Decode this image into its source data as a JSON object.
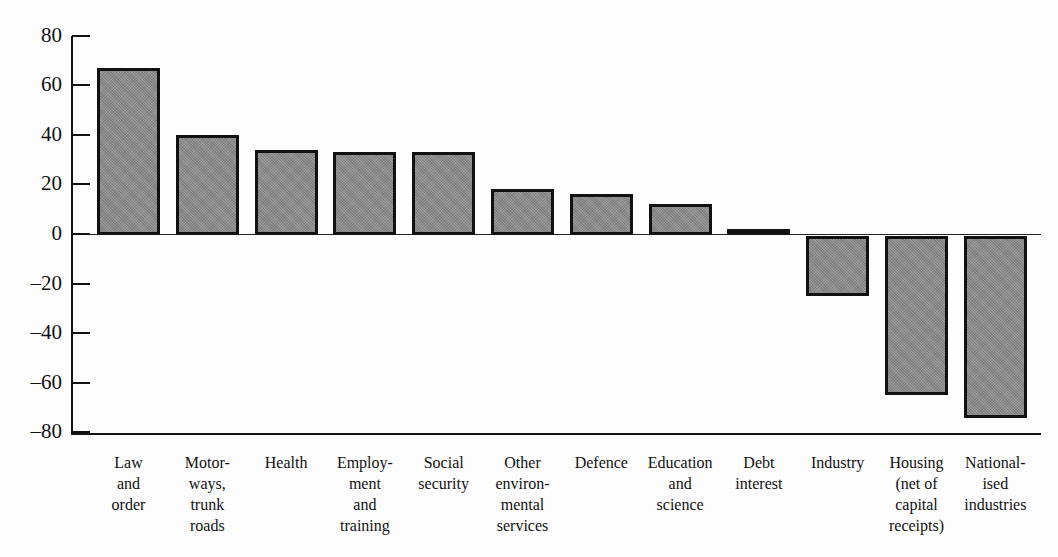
{
  "chart_data": {
    "type": "bar",
    "title": "",
    "xlabel": "",
    "ylabel": "",
    "ylim": [
      -80,
      80
    ],
    "yticks": [
      80,
      60,
      40,
      20,
      0,
      -20,
      -40,
      -60,
      -80
    ],
    "ytick_labels": [
      "80",
      "60",
      "40",
      "20",
      "0",
      "–20",
      "–40",
      "–60",
      "–80"
    ],
    "grid": false,
    "legend": null,
    "categories": [
      "Law and order",
      "Motorways, trunk roads",
      "Health",
      "Employment and training",
      "Social security",
      "Other environmental services",
      "Defence",
      "Education and science",
      "Debt interest",
      "Industry",
      "Housing (net of capital receipts)",
      "Nationalised industries"
    ],
    "category_label_lines": [
      [
        "Law",
        "and",
        "order"
      ],
      [
        "Motor-",
        "ways,",
        "trunk",
        "roads"
      ],
      [
        "Health"
      ],
      [
        "Employ-",
        "ment",
        "and",
        "training"
      ],
      [
        "Social",
        "security"
      ],
      [
        "Other",
        "environ-",
        "mental",
        "services"
      ],
      [
        "Defence"
      ],
      [
        "Education",
        "and",
        "science"
      ],
      [
        "Debt",
        "interest"
      ],
      [
        "Industry"
      ],
      [
        "Housing",
        "(net of",
        "capital",
        "receipts)"
      ],
      [
        "National-",
        "ised",
        "industries"
      ]
    ],
    "values": [
      67,
      40,
      34,
      33,
      33,
      18,
      16,
      12,
      2,
      -25,
      -65,
      -74
    ],
    "bar_fill": "#8f8f8f",
    "bar_edge": "#111111"
  }
}
